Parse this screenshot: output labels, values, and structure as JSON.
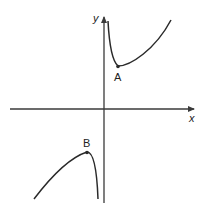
{
  "diagram": {
    "type": "function-graph",
    "axes": {
      "x_label": "x",
      "y_label": "y"
    },
    "points": [
      {
        "label": "A",
        "description": "local minimum, first quadrant"
      },
      {
        "label": "B",
        "description": "local maximum, third quadrant"
      }
    ],
    "colors": {
      "curve": "#2a2a2a",
      "axes": "#3a3a3a",
      "background": "#ffffff"
    }
  }
}
